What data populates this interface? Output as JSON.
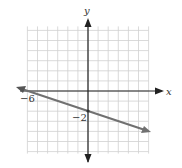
{
  "chart_data": {
    "type": "line",
    "title": "",
    "xlabel": "x",
    "ylabel": "y",
    "xlim": [
      -6,
      6
    ],
    "ylim": [
      -6,
      6
    ],
    "grid": true,
    "grid_step": 1,
    "annotations": [
      {
        "text": "−6",
        "at": [
          -6,
          0
        ],
        "meaning": "x-intercept"
      },
      {
        "text": "−2",
        "at": [
          0,
          -2
        ],
        "meaning": "y-intercept"
      }
    ],
    "series": [
      {
        "name": "line",
        "equation": "y = -x/3 - 2",
        "slope": -0.3333,
        "intercept": -2,
        "points": [
          [
            -6,
            0
          ],
          [
            0,
            -2
          ],
          [
            6,
            -4
          ]
        ],
        "arrows_both_ends": true,
        "color": "#6f6f6f"
      }
    ]
  },
  "labels": {
    "x_axis": "x",
    "y_axis": "y",
    "x_intercept": "−6",
    "y_intercept": "−2"
  },
  "colors": {
    "grid": "#d0d0d0",
    "axis": "#222222",
    "line": "#707070"
  }
}
